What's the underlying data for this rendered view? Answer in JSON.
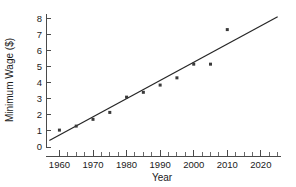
{
  "chart_data": {
    "type": "scatter",
    "title": "",
    "xlabel": "Year",
    "ylabel": "Minimum Wage ($)",
    "xlim": [
      1956,
      2026
    ],
    "ylim": [
      0,
      8.3
    ],
    "grid": false,
    "legend": "none",
    "x_ticks": [
      1960,
      1970,
      1980,
      1990,
      2000,
      2010,
      2020
    ],
    "x_tick_labels": [
      "1960",
      "1970",
      "1980",
      "1990",
      "2000",
      "2010",
      "2020"
    ],
    "x_minor_step": 2.5,
    "y_ticks": [
      0,
      1,
      2,
      3,
      4,
      5,
      6,
      7,
      8
    ],
    "y_tick_labels": [
      "0",
      "1",
      "2",
      "3",
      "4",
      "5",
      "6",
      "7",
      "8"
    ],
    "x": [
      1960,
      1965,
      1970,
      1975,
      1980,
      1985,
      1990,
      1995,
      2000,
      2005,
      2010
    ],
    "values": [
      1.05,
      1.3,
      1.72,
      2.15,
      3.1,
      3.4,
      3.85,
      4.3,
      5.15,
      5.15,
      7.3
    ],
    "series": [
      {
        "name": "Minimum Wage",
        "marker": "square",
        "color": "#3a3a3a",
        "points": [
          {
            "x": 1960,
            "y": 1.05
          },
          {
            "x": 1965,
            "y": 1.3
          },
          {
            "x": 1970,
            "y": 1.72
          },
          {
            "x": 1975,
            "y": 2.15
          },
          {
            "x": 1980,
            "y": 3.1
          },
          {
            "x": 1985,
            "y": 3.4
          },
          {
            "x": 1990,
            "y": 3.85
          },
          {
            "x": 1995,
            "y": 4.3
          },
          {
            "x": 2000,
            "y": 5.15
          },
          {
            "x": 2005,
            "y": 5.15
          },
          {
            "x": 2010,
            "y": 7.3
          }
        ]
      },
      {
        "name": "Trend line",
        "type": "line",
        "color": "#262626",
        "endpoints": [
          {
            "x": 1957,
            "y": 0.4
          },
          {
            "x": 2025,
            "y": 8.1
          }
        ]
      }
    ]
  }
}
